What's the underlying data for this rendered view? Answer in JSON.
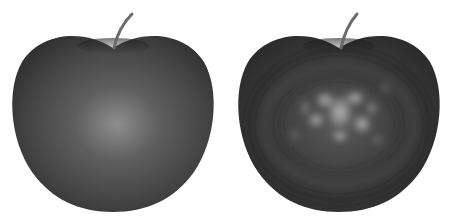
{
  "image": {
    "width": 450,
    "height": 217,
    "background": "#ffffff",
    "description": "Two grayscale rendered apples side by side: smooth shading (left) and noisy/textured shading (right)"
  },
  "apples": [
    {
      "label": "smooth-shaded-apple",
      "cx": 113,
      "body_color": "#3c3c3c",
      "highlight_color": "#8a8a8a"
    },
    {
      "label": "textured-shaded-apple",
      "cx": 339,
      "body_color": "#363636",
      "highlight_color": "#a8a8a8"
    }
  ]
}
